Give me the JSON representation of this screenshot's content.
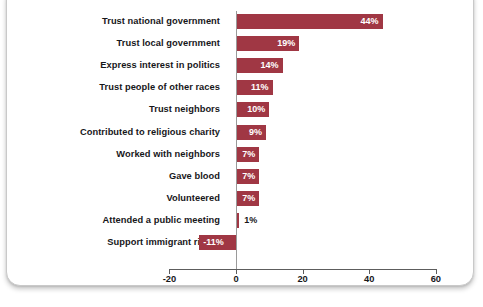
{
  "chart_data": {
    "type": "bar",
    "orientation": "horizontal",
    "title": "",
    "subtitle": "",
    "xlabel": "",
    "ylabel": "",
    "xlim": [
      -20,
      60
    ],
    "xticks": [
      -20,
      0,
      20,
      40,
      60
    ],
    "xtick_labels": [
      "-20",
      "0",
      "20",
      "40",
      "60"
    ],
    "grid": false,
    "legend": false,
    "bar_color": "#a03744",
    "zero_line_color": "#9a9a9a",
    "axis_color": "#5d5d5d",
    "label_color": "#17171a",
    "value_label_color_inside": "#ffffff",
    "categories": [
      "Trust national government",
      "Trust local government",
      "Express interest in politics",
      "Trust people of other races",
      "Trust neighbors",
      "Contributed to religious charity",
      "Worked with neighbors",
      "Gave blood",
      "Volunteered",
      "Attended a public meeting",
      "Support immigrant rights"
    ],
    "values": [
      44,
      19,
      14,
      11,
      10,
      9,
      7,
      7,
      7,
      1,
      -11
    ],
    "value_labels": [
      "44%",
      "19%",
      "14%",
      "11%",
      "10%",
      "9%",
      "7%",
      "7%",
      "7%",
      "1%",
      "-11%"
    ],
    "value_label_placement": [
      "inside",
      "inside",
      "inside",
      "inside",
      "inside",
      "inside",
      "inside",
      "inside",
      "inside",
      "outside",
      "inside"
    ],
    "bars": [
      {
        "category": "Trust national government",
        "value": 44,
        "label": "44%",
        "placement": "inside"
      },
      {
        "category": "Trust local government",
        "value": 19,
        "label": "19%",
        "placement": "inside"
      },
      {
        "category": "Express interest in politics",
        "value": 14,
        "label": "14%",
        "placement": "inside"
      },
      {
        "category": "Trust people of other races",
        "value": 11,
        "label": "11%",
        "placement": "inside"
      },
      {
        "category": "Trust neighbors",
        "value": 10,
        "label": "10%",
        "placement": "inside"
      },
      {
        "category": "Contributed to religious charity",
        "value": 9,
        "label": "9%",
        "placement": "inside"
      },
      {
        "category": "Worked with neighbors",
        "value": 7,
        "label": "7%",
        "placement": "inside"
      },
      {
        "category": "Gave blood",
        "value": 7,
        "label": "7%",
        "placement": "inside"
      },
      {
        "category": "Volunteered",
        "value": 7,
        "label": "7%",
        "placement": "inside"
      },
      {
        "category": "Attended a public meeting",
        "value": 1,
        "label": "1%",
        "placement": "outside"
      },
      {
        "category": "Support immigrant rights",
        "value": -11,
        "label": "-11%",
        "placement": "inside"
      }
    ]
  },
  "layout": {
    "zero_x_px": 236,
    "px_per_unit": 3.33,
    "bar_height_px": 15,
    "bar_pitch_px": 22.1,
    "first_bar_top_px": 14,
    "axis_y_px": 269,
    "tick_len_px": 5,
    "tick_label_y_px": 274
  }
}
